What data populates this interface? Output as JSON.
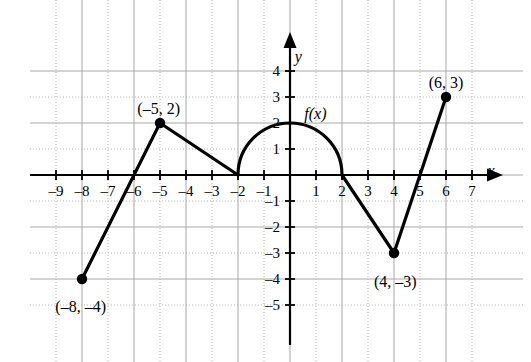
{
  "chart_data": {
    "type": "line",
    "title": "",
    "xlabel": "x",
    "ylabel": "y",
    "function_label": "f(x)",
    "xlim": [
      -9.8,
      7.8
    ],
    "ylim": [
      -5.8,
      4.8
    ],
    "grid": true,
    "grid_step": 1,
    "legend": "none",
    "x_ticks": [
      -9,
      -8,
      -7,
      -6,
      -5,
      -4,
      -3,
      -2,
      -1,
      1,
      2,
      3,
      4,
      5,
      6,
      7
    ],
    "x_tick_labels": [
      "–9",
      "–8",
      "–7",
      "–6",
      "–5",
      "–4",
      "–3",
      "–2",
      "–1",
      "1",
      "2",
      "3",
      "4",
      "5",
      "6",
      "7"
    ],
    "y_ticks": [
      4,
      3,
      2,
      1,
      -1,
      -2,
      -3,
      -4,
      -5
    ],
    "y_tick_labels": [
      "4",
      "3",
      "2",
      "1",
      "–1",
      "–2",
      "–3",
      "–4",
      "–5"
    ],
    "series": [
      {
        "name": "f(x)",
        "segments": [
          {
            "kind": "polyline",
            "points": [
              [
                -8,
                -4
              ],
              [
                -5,
                2
              ],
              [
                -2,
                0
              ]
            ]
          },
          {
            "kind": "semicircle",
            "center": [
              0,
              0
            ],
            "radius": 2,
            "from": [
              -2,
              0
            ],
            "to": [
              2,
              0
            ],
            "apex": [
              0,
              2
            ]
          },
          {
            "kind": "polyline",
            "points": [
              [
                2,
                0
              ],
              [
                4,
                -3
              ],
              [
                6,
                3
              ]
            ]
          }
        ]
      }
    ],
    "marked_points": [
      {
        "x": -8,
        "y": -4,
        "label": "(–8, –4)",
        "label_x": -8.05,
        "label_y": -4.75
      },
      {
        "x": -5,
        "y": 2,
        "label": "(–5, 2)",
        "label_x": -5.05,
        "label_y": 2.85
      },
      {
        "x": 4,
        "y": -3,
        "label": "(4, –3)",
        "label_x": 4.05,
        "label_y": -3.8
      },
      {
        "x": 6,
        "y": 3,
        "label": "(6, 3)",
        "label_x": 6.0,
        "label_y": 3.85
      }
    ],
    "x_intercepts": [
      -6,
      -2,
      2,
      5
    ],
    "annotations": [
      {
        "text": "f(x)",
        "x": 0.55,
        "y": 2.65
      },
      {
        "text": "y",
        "x": 0.18,
        "y": 4.85
      },
      {
        "text": "x",
        "x": 7.6,
        "y": 0.45
      }
    ],
    "colors": {
      "curve": "#000000",
      "axis": "#000000",
      "grid_solid": "#a8a8a8",
      "grid_dotted": "#b4b4b4",
      "background": "#ffffff",
      "point": "#000000"
    }
  }
}
